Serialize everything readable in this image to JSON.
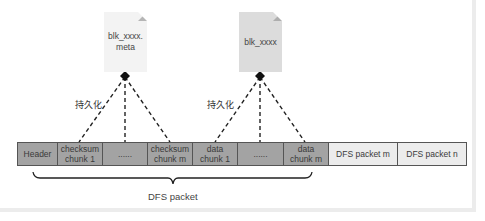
{
  "diagram": {
    "documents": [
      {
        "id": "meta",
        "label_line1": "blk_xxxx.",
        "label_line2": "meta",
        "fill": "#f3f3f3"
      },
      {
        "id": "data",
        "label_line1": "blk_xxxx",
        "label_line2": "",
        "fill": "#dcdcdc"
      }
    ],
    "edge_labels": {
      "persist_left": "持久化",
      "persist_right": "持久化"
    },
    "packet_bar": {
      "cells": [
        {
          "line1": "Header",
          "line2": "",
          "style": "dark",
          "width": 40
        },
        {
          "line1": "checksum",
          "line2": "chunk 1",
          "style": "dark",
          "width": 45
        },
        {
          "line1": "......",
          "line2": "",
          "style": "dark",
          "width": 45
        },
        {
          "line1": "checksum",
          "line2": "chunk m",
          "style": "dark",
          "width": 45
        },
        {
          "line1": "data",
          "line2": "chunk 1",
          "style": "dark",
          "width": 45
        },
        {
          "line1": "......",
          "line2": "",
          "style": "dark",
          "width": 46
        },
        {
          "line1": "data",
          "line2": "chunk m",
          "style": "dark",
          "width": 45
        },
        {
          "line1": "DFS packet m",
          "line2": "",
          "style": "light",
          "width": 69
        },
        {
          "line1": "DFS packet n",
          "line2": "",
          "style": "light",
          "width": 68
        }
      ]
    },
    "brace_label": "DFS packet",
    "colors": {
      "cell_dark": "#a3a3a3",
      "cell_light": "#ececec",
      "line": "#222222"
    }
  }
}
